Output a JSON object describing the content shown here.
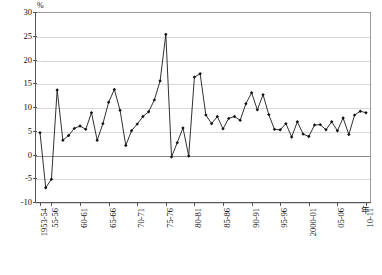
{
  "chart_data": {
    "type": "line",
    "title": "",
    "subtitle": "",
    "xlabel": "年",
    "ylabel": "%",
    "unit_label": "%",
    "ylim": [
      -10,
      30
    ],
    "ytick_step": 5,
    "yticks": [
      30,
      25,
      20,
      15,
      10,
      5,
      0,
      -5,
      -10
    ],
    "ytick_labels": [
      "30",
      "25",
      "20",
      "15",
      "10",
      "5",
      "0",
      "-5",
      "-10"
    ],
    "grid": true,
    "grid_axis": "y",
    "legend": "none",
    "marker": "diamond",
    "line_color": "#1a1a1a",
    "marker_color": "#111111",
    "x_start_label": "1953-54",
    "x_end_label": "10-11",
    "xtick_labels": [
      "1953-54",
      "55-56",
      "60-61",
      "65-66",
      "70-71",
      "75-76",
      "80-81",
      "85-86",
      "90-91",
      "95-96",
      "2000-01",
      "05-06",
      "10-11"
    ],
    "xtick_indices": [
      0,
      2,
      7,
      12,
      17,
      22,
      27,
      32,
      37,
      42,
      47,
      52,
      57
    ],
    "categories": [
      "1953-54",
      "54-55",
      "55-56",
      "56-57",
      "57-58",
      "58-59",
      "59-60",
      "60-61",
      "61-62",
      "62-63",
      "63-64",
      "64-65",
      "65-66",
      "66-67",
      "67-68",
      "68-69",
      "69-70",
      "70-71",
      "71-72",
      "72-73",
      "73-74",
      "74-75",
      "75-76",
      "76-77",
      "77-78",
      "78-79",
      "79-80",
      "80-81",
      "81-82",
      "82-83",
      "83-84",
      "84-85",
      "85-86",
      "86-87",
      "87-88",
      "88-89",
      "89-90",
      "90-91",
      "91-92",
      "92-93",
      "93-94",
      "94-95",
      "95-96",
      "96-97",
      "97-98",
      "98-99",
      "99-2000",
      "2000-01",
      "01-02",
      "02-03",
      "03-04",
      "04-05",
      "05-06",
      "06-07",
      "07-08",
      "08-09",
      "09-10",
      "10-11"
    ],
    "values": [
      4.6,
      -7.0,
      -5.2,
      13.6,
      3.0,
      4.0,
      5.5,
      6.0,
      5.3,
      8.8,
      3.0,
      6.5,
      11.0,
      13.7,
      9.3,
      1.9,
      5.0,
      6.4,
      8.0,
      9.0,
      11.5,
      15.5,
      25.3,
      -0.5,
      2.5,
      5.6,
      -0.3,
      16.3,
      17.0,
      8.3,
      6.5,
      8.0,
      5.4,
      7.6,
      8.0,
      7.2,
      10.7,
      13.0,
      9.4,
      12.6,
      8.4,
      5.3,
      5.2,
      6.5,
      3.7,
      6.9,
      4.3,
      3.8,
      6.2,
      6.3,
      5.2,
      6.9,
      5.0,
      7.7,
      4.2,
      8.3,
      9.1,
      8.8
    ]
  }
}
